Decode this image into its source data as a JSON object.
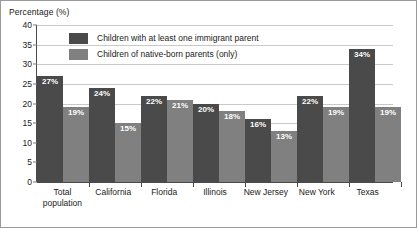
{
  "chart_data": {
    "type": "bar",
    "title": "",
    "ylabel": "Percentage (%)",
    "xlabel": "",
    "ylim": [
      0,
      40
    ],
    "yticks": [
      0,
      5,
      10,
      15,
      20,
      25,
      30,
      35,
      40
    ],
    "grid": true,
    "legend_position": "top-center-inside",
    "categories": [
      "Total\npopulation",
      "California",
      "Florida",
      "Illinois",
      "New Jersey",
      "New York",
      "Texas"
    ],
    "series": [
      {
        "name": "Children with at least one immigrant parent",
        "color": "#4a4a4a",
        "values": [
          27,
          24,
          22,
          20,
          16,
          22,
          34
        ],
        "labels": [
          "27%",
          "24%",
          "22%",
          "20%",
          "16%",
          "22%",
          "34%"
        ]
      },
      {
        "name": "Children of native-born parents (only)",
        "color": "#808080",
        "values": [
          19,
          15,
          21,
          18,
          13,
          19,
          19
        ],
        "labels": [
          "19%",
          "15%",
          "21%",
          "18%",
          "13%",
          "19%",
          "19%"
        ]
      }
    ]
  },
  "axis": {
    "y_title": "Percentage (%)",
    "tick_labels": [
      "40",
      "35",
      "30",
      "25",
      "20",
      "15",
      "10",
      "5",
      "0"
    ]
  },
  "legend": {
    "items": [
      {
        "label": "Children with at least one immigrant parent",
        "swatch": "#4a4a4a"
      },
      {
        "label": "Children of native-born parents (only)",
        "swatch": "#808080"
      }
    ]
  }
}
